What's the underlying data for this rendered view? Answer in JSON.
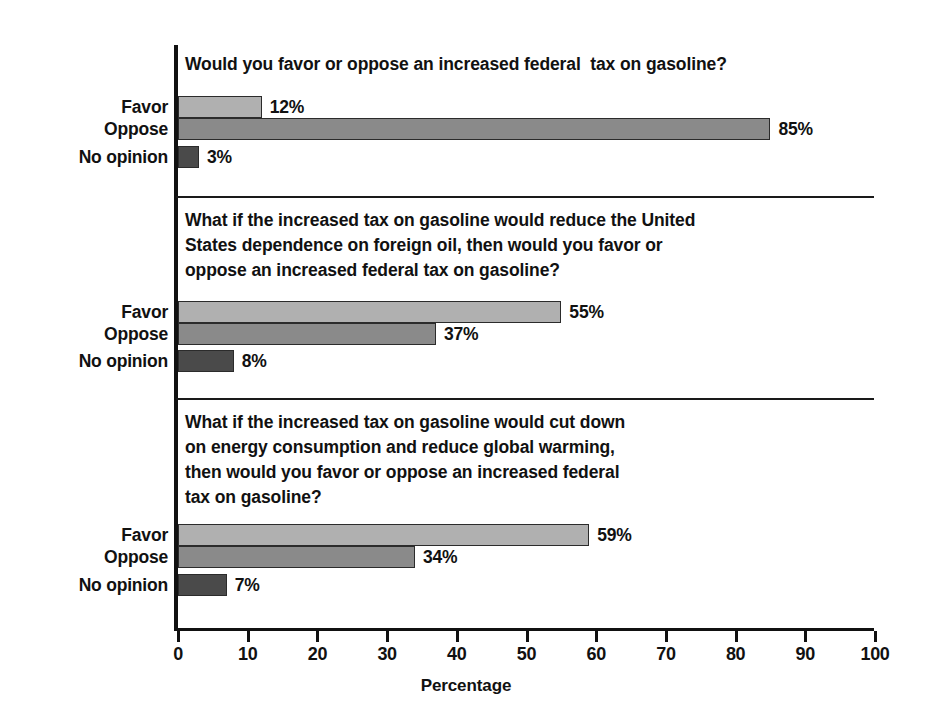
{
  "chart_data": {
    "type": "bar",
    "orientation": "horizontal",
    "title": "",
    "xlabel": "Percentage",
    "ylabel": "",
    "xlim": [
      0,
      100
    ],
    "xticks": [
      0,
      10,
      20,
      30,
      40,
      50,
      60,
      70,
      80,
      90,
      100
    ],
    "xtick_labels": [
      "0",
      "10",
      "20",
      "30",
      "40",
      "50",
      "60",
      "70",
      "80",
      "90",
      "100"
    ],
    "grid": false,
    "legend": "none",
    "categories": [
      "Favor",
      "Oppose",
      "No opinion"
    ],
    "value_suffix": "%",
    "panels": [
      {
        "question": "Would you favor or oppose an increased federal  tax on gasoline?",
        "categories": [
          "Favor",
          "Oppose",
          "No opinion"
        ],
        "values": [
          12,
          85,
          3
        ],
        "value_labels": [
          "12%",
          "85%",
          "3%"
        ]
      },
      {
        "question": "What if the increased tax on gasoline would reduce the United\nStates dependence on foreign oil, then would you favor or\noppose an increased federal tax on gasoline?",
        "categories": [
          "Favor",
          "Oppose",
          "No opinion"
        ],
        "values": [
          55,
          37,
          8
        ],
        "value_labels": [
          "55%",
          "37%",
          "8%"
        ]
      },
      {
        "question": "What if the increased tax on gasoline would cut down\non energy consumption and reduce global warming,\nthen would you favor or oppose an increased federal\ntax on gasoline?",
        "categories": [
          "Favor",
          "Oppose",
          "No opinion"
        ],
        "values": [
          59,
          34,
          7
        ],
        "value_labels": [
          "59%",
          "34%",
          "7%"
        ]
      }
    ],
    "series_colors": {
      "Favor": "#b0b0b0",
      "Oppose": "#8a8a8a",
      "No opinion": "#4a4a4a"
    }
  },
  "axis": {
    "title": "Percentage",
    "ticks": [
      "0",
      "10",
      "20",
      "30",
      "40",
      "50",
      "60",
      "70",
      "80",
      "90",
      "100"
    ]
  },
  "panels": [
    {
      "question": "Would you favor or oppose an increased federal  tax on gasoline?",
      "rows": [
        {
          "label": "Favor",
          "value_label": "12%"
        },
        {
          "label": "Oppose",
          "value_label": "85%"
        },
        {
          "label": "No opinion",
          "value_label": "3%"
        }
      ]
    },
    {
      "question": "What if the increased tax on gasoline would reduce the United\nStates dependence on foreign oil, then would you favor or\noppose an increased federal tax on gasoline?",
      "rows": [
        {
          "label": "Favor",
          "value_label": "55%"
        },
        {
          "label": "Oppose",
          "value_label": "37%"
        },
        {
          "label": "No opinion",
          "value_label": "8%"
        }
      ]
    },
    {
      "question": "What if the increased tax on gasoline would cut down\non energy consumption and reduce global warming,\nthen would you favor or oppose an increased federal\ntax on gasoline?",
      "rows": [
        {
          "label": "Favor",
          "value_label": "59%"
        },
        {
          "label": "Oppose",
          "value_label": "34%"
        },
        {
          "label": "No opinion",
          "value_label": "7%"
        }
      ]
    }
  ]
}
